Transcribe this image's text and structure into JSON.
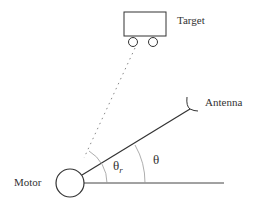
{
  "diagram": {
    "labels": {
      "target": "Target",
      "antenna": "Antenna",
      "motor": "Motor",
      "theta": "θ",
      "theta_r_base": "θ",
      "theta_r_sub": "r"
    },
    "colors": {
      "stroke": "#333333",
      "arc": "#999999",
      "dotted": "#888888"
    }
  }
}
